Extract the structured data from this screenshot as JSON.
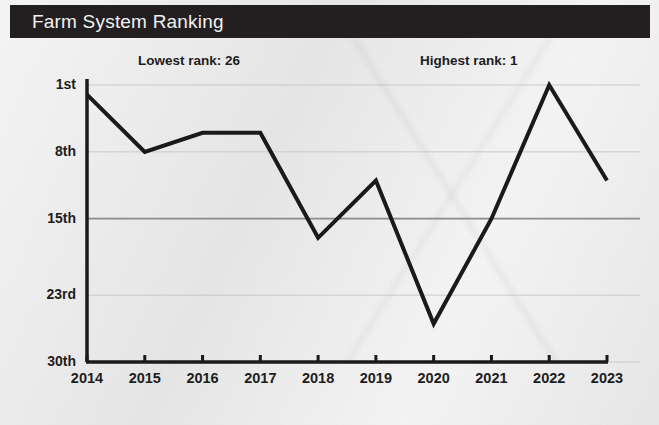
{
  "header": {
    "title": "Farm System Ranking"
  },
  "annotations": {
    "lowest": "Lowest rank: 26",
    "highest": "Highest rank: 1"
  },
  "colors": {
    "banner": "#231f20",
    "banner_text": "#f2f2f2",
    "background": "#ececed",
    "line": "#1a1a1a",
    "axis": "#1a1a1a",
    "gridline": "#c9c9cc",
    "reference_line": "#8a8a90",
    "tick_text": "#1d1d1d"
  },
  "chart_data": {
    "type": "line",
    "title": "Farm System Ranking",
    "xlabel": "",
    "ylabel": "",
    "x": [
      2014,
      2015,
      2016,
      2017,
      2018,
      2019,
      2020,
      2021,
      2022,
      2023
    ],
    "categories": [
      "2014",
      "2015",
      "2016",
      "2017",
      "2018",
      "2019",
      "2020",
      "2021",
      "2022",
      "2023"
    ],
    "values": [
      2,
      8,
      6,
      6,
      17,
      11,
      26,
      15,
      1,
      11
    ],
    "series": [
      {
        "name": "Farm System Ranking",
        "values": [
          2,
          8,
          6,
          6,
          17,
          11,
          26,
          15,
          1,
          11
        ]
      }
    ],
    "y_ticks": [
      1,
      8,
      15,
      23,
      30
    ],
    "y_tick_labels": [
      "1st",
      "8th",
      "15th",
      "23rd",
      "30th"
    ],
    "x_tick_labels": [
      "2014",
      "2015",
      "2016",
      "2017",
      "2018",
      "2019",
      "2020",
      "2021",
      "2022",
      "2023"
    ],
    "ylim": [
      1,
      30
    ],
    "y_inverted": true,
    "grid": true,
    "reference_line": 15,
    "legend": "none",
    "annotations": [
      {
        "text": "Lowest rank: 26",
        "value": 26,
        "year": 2020
      },
      {
        "text": "Highest rank: 1",
        "value": 1,
        "year": 2022
      }
    ]
  }
}
